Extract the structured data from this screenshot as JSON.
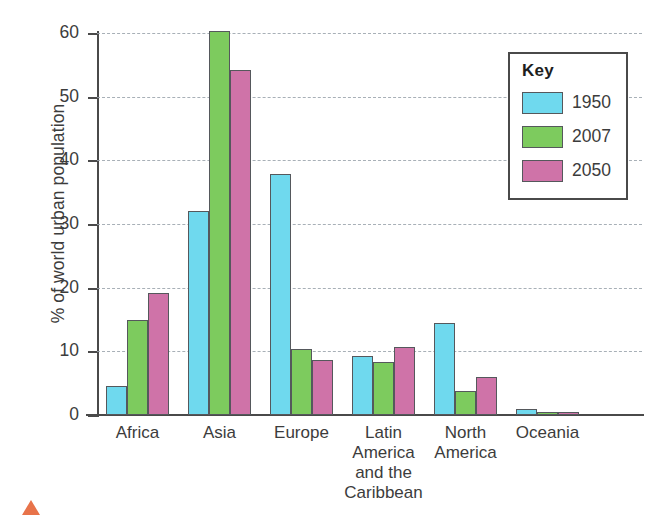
{
  "chart_data": {
    "type": "bar",
    "title": "",
    "xlabel": "",
    "ylabel": "% of world urban population",
    "ylim": [
      0,
      60
    ],
    "yticks": [
      0,
      10,
      20,
      30,
      40,
      50,
      60
    ],
    "ytick_labels": [
      "0",
      "10",
      "20",
      "30",
      "40",
      "50",
      "60"
    ],
    "grid": true,
    "grid_style": "dashed horizontal",
    "legend_position": "top-right inside",
    "legend_title": "Key",
    "categories": [
      "Africa",
      "Asia",
      "Europe",
      "Latin America and the Caribbean",
      "North America",
      "Oceania"
    ],
    "category_label_lines": [
      [
        "Africa"
      ],
      [
        "Asia"
      ],
      [
        "Europe"
      ],
      [
        "Latin",
        "America",
        "and the",
        "Caribbean"
      ],
      [
        "North",
        "America"
      ],
      [
        "Oceania"
      ]
    ],
    "series": [
      {
        "name": "1950",
        "color": "#6FD9EE",
        "values": [
          4.5,
          32.0,
          37.8,
          9.2,
          14.5,
          0.9
        ]
      },
      {
        "name": "2007",
        "color": "#7DCB5E",
        "values": [
          15.0,
          60.3,
          10.3,
          8.4,
          3.7,
          0.4
        ]
      },
      {
        "name": "2050",
        "color": "#CF73A8",
        "values": [
          19.1,
          54.2,
          8.6,
          10.7,
          6.0,
          0.5
        ]
      }
    ]
  },
  "legend": {
    "title": "Key",
    "entries": [
      {
        "label": "1950",
        "color": "#6FD9EE"
      },
      {
        "label": "2007",
        "color": "#7DCB5E"
      },
      {
        "label": "2050",
        "color": "#CF73A8"
      }
    ]
  },
  "axes": {
    "y_title": "% of world urban population"
  }
}
